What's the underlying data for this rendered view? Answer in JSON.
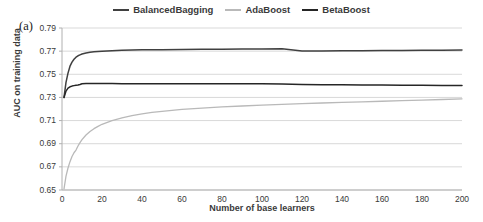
{
  "panel": {
    "label": "(a)"
  },
  "colors": {
    "balanced_bagging": "#404040",
    "ada_boost": "#b9b9b9",
    "beta_boost": "#262626",
    "grid": "#d9d9d9",
    "axis": "#b0b0b0",
    "text": "#3a3a3a"
  },
  "legend": {
    "position": "top-center",
    "entries": [
      {
        "label": "BalancedBagging",
        "color": "#404040"
      },
      {
        "label": "AdaBoost",
        "color": "#b9b9b9"
      },
      {
        "label": "BetaBoost",
        "color": "#262626"
      }
    ]
  },
  "chart_data": {
    "type": "line",
    "title": "",
    "xlabel": "Number of base learners",
    "ylabel": "AUC on training data",
    "xlim": [
      0,
      200
    ],
    "ylim": [
      0.65,
      0.79
    ],
    "xticks": [
      0,
      20,
      40,
      60,
      80,
      100,
      120,
      140,
      160,
      180,
      200
    ],
    "yticks": [
      0.65,
      0.67,
      0.69,
      0.71,
      0.73,
      0.75,
      0.77,
      0.79
    ],
    "ytick_labels": [
      "0.65",
      "0.67",
      "0.69",
      "0.71",
      "0.73",
      "0.75",
      "0.77",
      "0.79"
    ],
    "xtick_labels": [
      "0",
      "20",
      "40",
      "60",
      "80",
      "100",
      "120",
      "140",
      "160",
      "180",
      "200"
    ],
    "grid": true,
    "grid_axis": "y",
    "x": [
      1,
      2,
      3,
      4,
      5,
      6,
      7,
      8,
      9,
      10,
      12,
      14,
      16,
      18,
      20,
      25,
      30,
      35,
      40,
      45,
      50,
      60,
      70,
      80,
      90,
      100,
      110,
      120,
      130,
      140,
      150,
      160,
      170,
      180,
      190,
      200
    ],
    "series": [
      {
        "name": "BalancedBagging",
        "color": "#404040",
        "values": [
          0.73,
          0.743,
          0.751,
          0.757,
          0.7605,
          0.763,
          0.7648,
          0.766,
          0.7668,
          0.7675,
          0.7684,
          0.769,
          0.7694,
          0.7697,
          0.77,
          0.7704,
          0.7707,
          0.7709,
          0.7711,
          0.7712,
          0.7713,
          0.7715,
          0.7716,
          0.7717,
          0.7718,
          0.7719,
          0.772,
          0.7701,
          0.7702,
          0.7703,
          0.7704,
          0.7705,
          0.7706,
          0.7707,
          0.7708,
          0.771
        ]
      },
      {
        "name": "AdaBoost",
        "color": "#b9b9b9",
        "values": [
          0.651,
          0.662,
          0.669,
          0.6745,
          0.679,
          0.6822,
          0.6845,
          0.688,
          0.691,
          0.6935,
          0.6975,
          0.7005,
          0.703,
          0.705,
          0.7068,
          0.71,
          0.7124,
          0.7142,
          0.7158,
          0.717,
          0.718,
          0.7196,
          0.7208,
          0.7218,
          0.7226,
          0.7234,
          0.724,
          0.7246,
          0.7252,
          0.7257,
          0.7262,
          0.7267,
          0.7272,
          0.7277,
          0.7282,
          0.7288
        ]
      },
      {
        "name": "BetaBoost",
        "color": "#262626",
        "values": [
          0.73,
          0.7355,
          0.738,
          0.7392,
          0.7398,
          0.7402,
          0.7405,
          0.7408,
          0.7412,
          0.7418,
          0.742,
          0.742,
          0.742,
          0.742,
          0.742,
          0.742,
          0.7419,
          0.7419,
          0.7419,
          0.7419,
          0.7419,
          0.7418,
          0.7418,
          0.7418,
          0.7418,
          0.7418,
          0.7417,
          0.7412,
          0.741,
          0.7409,
          0.7408,
          0.7407,
          0.7406,
          0.7405,
          0.7404,
          0.7403
        ]
      }
    ]
  }
}
